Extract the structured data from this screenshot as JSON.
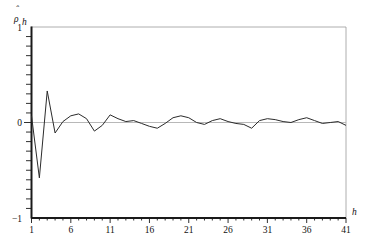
{
  "chart_data": {
    "type": "line",
    "title": "",
    "subtitle": "",
    "xlabel": "h",
    "ylabel": "ρ̂",
    "ylabel_sub": "h",
    "ylabel_display": "ρ̂h",
    "xlim": [
      1,
      41
    ],
    "ylim": [
      -1,
      1
    ],
    "grid": false,
    "legend": null,
    "zero_reference_line": 0,
    "xticks": [
      1,
      6,
      11,
      16,
      21,
      26,
      31,
      36,
      41
    ],
    "xtick_labels": [
      "1",
      "6",
      "11",
      "16",
      "21",
      "26",
      "31",
      "36",
      "41"
    ],
    "x_minor_tick_step": 1,
    "yticks": [
      -1,
      0,
      1
    ],
    "ytick_labels": [
      "−1",
      "0",
      "1"
    ],
    "y_minor_tick_step": 0.1,
    "series_name": "sample autocorrelation",
    "x": [
      1,
      2,
      3,
      4,
      5,
      6,
      7,
      8,
      9,
      10,
      11,
      12,
      13,
      14,
      15,
      16,
      17,
      18,
      19,
      20,
      21,
      22,
      23,
      24,
      25,
      26,
      27,
      28,
      29,
      30,
      31,
      32,
      33,
      34,
      35,
      36,
      37,
      38,
      39,
      40,
      41
    ],
    "values": [
      0.07,
      -0.58,
      0.33,
      -0.11,
      0.01,
      0.07,
      0.09,
      0.04,
      -0.09,
      -0.03,
      0.08,
      0.04,
      0.01,
      0.02,
      -0.01,
      -0.04,
      -0.06,
      -0.01,
      0.05,
      0.07,
      0.05,
      0.0,
      -0.02,
      0.02,
      0.04,
      0.01,
      -0.01,
      -0.02,
      -0.06,
      0.02,
      0.04,
      0.03,
      0.01,
      0.0,
      0.03,
      0.05,
      0.02,
      -0.01,
      0.0,
      0.01,
      -0.03
    ],
    "colors": {
      "series": "#2b2b2b",
      "axis": "#1a1a1a",
      "frame": "#9a9a9a",
      "zero_line": "#b0b0b0",
      "background": "#ffffff"
    }
  }
}
